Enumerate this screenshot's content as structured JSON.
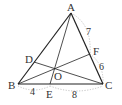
{
  "diagram": {
    "points": {
      "A": {
        "label": "A",
        "x": 71,
        "y": 13
      },
      "B": {
        "label": "B",
        "x": 18,
        "y": 84
      },
      "C": {
        "label": "C",
        "x": 103,
        "y": 84
      },
      "D": {
        "label": "D",
        "x": 34,
        "y": 62
      },
      "E": {
        "label": "E",
        "x": 50,
        "y": 84
      },
      "F": {
        "label": "F",
        "x": 90,
        "y": 54
      },
      "O": {
        "label": "O",
        "x": 55,
        "y": 69
      }
    },
    "lengths": {
      "BE": "4",
      "EC": "8",
      "AF": "7",
      "FC": "6"
    }
  }
}
